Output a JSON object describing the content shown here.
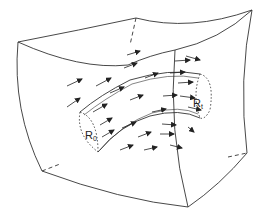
{
  "figure": {
    "labels": {
      "r0": {
        "base": "R",
        "sub": "0"
      },
      "r1": {
        "base": "R",
        "sub": "t"
      }
    },
    "colors": {
      "line": "#333333",
      "background": "#ffffff"
    }
  }
}
